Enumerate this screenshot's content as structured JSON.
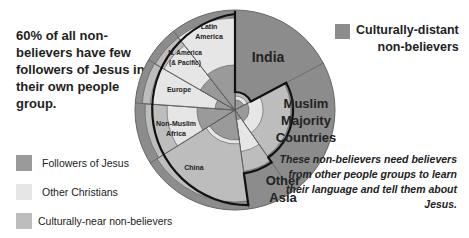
{
  "headline": "60% of all non-believers have few followers of Jesus in their own people group.",
  "note": "These non-believers need believers from other people groups to learn their language and tell them about Jesus.",
  "legend": {
    "culturally_distant": {
      "label_line1": "Culturally-distant",
      "label_line2": "non-believers",
      "color": "#8c8c8c"
    },
    "items": [
      {
        "label": "Followers of Jesus",
        "color": "#9a9a9a"
      },
      {
        "label": "Other Christians",
        "color": "#e6e6e6"
      },
      {
        "label": "Culturally-near non-believers",
        "color": "#bdbdbd"
      }
    ]
  },
  "chart_data": {
    "type": "polar-area",
    "title": "60% of all non-believers have few followers of Jesus in their own people group.",
    "center": [
      235,
      110
    ],
    "outer_radius": 100,
    "series_legend": [
      "Followers of Jesus",
      "Other Christians",
      "Culturally-near non-believers",
      "Culturally-distant non-believers"
    ],
    "regions": [
      {
        "name": "India",
        "start_deg": 0,
        "end_deg": 62,
        "label": "India"
      },
      {
        "name": "Muslim Majority Countries",
        "start_deg": 62,
        "end_deg": 145,
        "label": "Muslim Majority Countries"
      },
      {
        "name": "Other Asia",
        "start_deg": 145,
        "end_deg": 172,
        "label": "Other Asia"
      },
      {
        "name": "China",
        "start_deg": 172,
        "end_deg": 238,
        "label": "China"
      },
      {
        "name": "Non-Muslim Africa",
        "start_deg": 238,
        "end_deg": 274,
        "label": "Non-Muslim Africa"
      },
      {
        "name": "Europe",
        "start_deg": 274,
        "end_deg": 300,
        "label": "Europe"
      },
      {
        "name": "N. America (& Pacific)",
        "start_deg": 300,
        "end_deg": 322,
        "label": "N. America (& Pacific)"
      },
      {
        "name": "Latin America",
        "start_deg": 322,
        "end_deg": 360,
        "label": "Latin America"
      }
    ],
    "annotation": "Bold outline encloses regions with few followers of Jesus (60% of non-believers)"
  },
  "labels": {
    "india": "India",
    "muslim": [
      "Muslim",
      "Majority",
      "Countries"
    ],
    "other_asia": [
      "Other",
      "Asia"
    ],
    "china": "China",
    "africa": [
      "Non-Muslim",
      "Africa"
    ],
    "europe": "Europe",
    "namerica": [
      "N. America",
      "(& Pacific)"
    ],
    "latam": [
      "Latin",
      "America"
    ]
  }
}
